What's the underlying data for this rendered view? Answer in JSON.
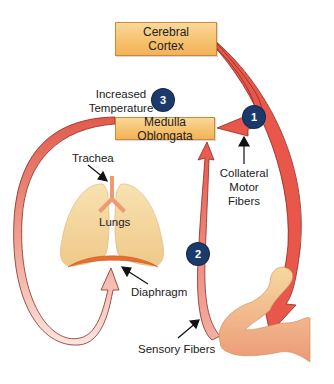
{
  "nodes": {
    "cerebral_cortex": "Cerebral Cortex",
    "medulla_oblongata": "Medulla Oblongata"
  },
  "labels": {
    "increased_temperature_line1": "Increased",
    "increased_temperature_line2": "Temperature",
    "trachea": "Trachea",
    "lungs": "Lungs",
    "diaphragm": "Diaphragm",
    "collateral_line1": "Collateral",
    "collateral_line2": "Motor",
    "collateral_line3": "Fibers",
    "sensory_fibers": "Sensory Fibers"
  },
  "badges": {
    "one": "1",
    "two": "2",
    "three": "3"
  },
  "colors": {
    "arrow_red": "#e8574a",
    "box_fill": "#f6c26e",
    "badge_navy": "#1b3a6b",
    "lung_fill": "#f5d9a0",
    "diaphragm": "#e8702f"
  }
}
